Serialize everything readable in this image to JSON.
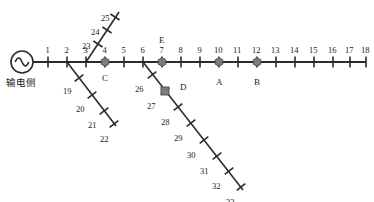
{
  "figure": {
    "title": "",
    "source": {
      "symbol_name": "ac-source-symbol",
      "label": "输电侧",
      "label_x": 6,
      "label_y": 78,
      "cx": 22,
      "cy": 62,
      "r": 11
    },
    "colors": {
      "line": "#2b2b2b",
      "marker_fill": "#7d7d7d",
      "marker_stroke": "#4a4a4a",
      "text": "#1a1a1a",
      "background": "#ffffff"
    },
    "line_width": 1.6,
    "tick_length": 11
  },
  "chart_data": {
    "type": "diagram",
    "diagram_kind": "single-line power distribution feeder",
    "main_feeder": {
      "y": 62,
      "x_start": 33,
      "x_end": 366,
      "nodes": [
        {
          "id": "1",
          "x": 48
        },
        {
          "id": "2",
          "x": 67
        },
        {
          "id": "3",
          "x": 86
        },
        {
          "id": "4",
          "x": 105
        },
        {
          "id": "5",
          "x": 124
        },
        {
          "id": "6",
          "x": 143
        },
        {
          "id": "7",
          "x": 162
        },
        {
          "id": "8",
          "x": 181
        },
        {
          "id": "9",
          "x": 200
        },
        {
          "id": "10",
          "x": 219
        },
        {
          "id": "11",
          "x": 238
        },
        {
          "id": "12",
          "x": 257
        },
        {
          "id": "13",
          "x": 276
        },
        {
          "id": "14",
          "x": 295
        },
        {
          "id": "15",
          "x": 314
        },
        {
          "id": "16",
          "x": 333
        },
        {
          "id": "17",
          "x": 350
        },
        {
          "id": "18",
          "x": 366
        }
      ]
    },
    "branches": [
      {
        "name": "upper-branch-from-node-3",
        "from_node": "3",
        "origin": {
          "x": 86,
          "y": 62
        },
        "end": {
          "x": 119,
          "y": 12
        },
        "nodes": [
          {
            "id": "23",
            "x": 98,
            "y": 44,
            "label_dx": -16,
            "label_dy": -2
          },
          {
            "id": "24",
            "x": 107,
            "y": 30,
            "label_dx": -16,
            "label_dy": -2
          },
          {
            "id": "25",
            "x": 115,
            "y": 17,
            "label_dx": -14,
            "label_dy": -3
          }
        ]
      },
      {
        "name": "lower-left-branch-from-node-2",
        "from_node": "2",
        "origin": {
          "x": 67,
          "y": 62
        },
        "end": {
          "x": 116,
          "y": 126
        },
        "nodes": [
          {
            "id": "19",
            "x": 79,
            "y": 78,
            "label_dx": -16,
            "label_dy": 9
          },
          {
            "id": "20",
            "x": 92,
            "y": 95,
            "label_dx": -16,
            "label_dy": 10
          },
          {
            "id": "21",
            "x": 104,
            "y": 111,
            "label_dx": -16,
            "label_dy": 10
          },
          {
            "id": "22",
            "x": 114,
            "y": 124,
            "label_dx": -14,
            "label_dy": 11
          }
        ]
      },
      {
        "name": "lower-right-branch-from-node-6",
        "from_node": "6",
        "origin": {
          "x": 143,
          "y": 62
        },
        "end": {
          "x": 243,
          "y": 190
        },
        "nodes": [
          {
            "id": "26",
            "x": 152,
            "y": 75,
            "label_dx": -17,
            "label_dy": 10
          },
          {
            "id": "27",
            "x": 165,
            "y": 91,
            "label_dx": -18,
            "label_dy": 11
          },
          {
            "id": "28",
            "x": 178,
            "y": 107,
            "label_dx": -17,
            "label_dy": 11
          },
          {
            "id": "29",
            "x": 191,
            "y": 123,
            "label_dx": -17,
            "label_dy": 11
          },
          {
            "id": "30",
            "x": 204,
            "y": 140,
            "label_dx": -17,
            "label_dy": 11
          },
          {
            "id": "31",
            "x": 217,
            "y": 156,
            "label_dx": -17,
            "label_dy": 11
          },
          {
            "id": "32",
            "x": 229,
            "y": 171,
            "label_dx": -17,
            "label_dy": 11
          },
          {
            "id": "33",
            "x": 241,
            "y": 187,
            "label_dx": -15,
            "label_dy": 11
          }
        ]
      }
    ],
    "markers": [
      {
        "label": "C",
        "node": "4",
        "x": 105,
        "y": 62,
        "shape": "hexagon",
        "label_x": 102,
        "label_y": 74
      },
      {
        "label": "E",
        "node": "7",
        "x": 162,
        "y": 62,
        "shape": "hexagon",
        "label_x": 159,
        "label_y": 36
      },
      {
        "label": "A",
        "node": "10",
        "x": 219,
        "y": 62,
        "shape": "hexagon",
        "label_x": 216,
        "label_y": 78
      },
      {
        "label": "B",
        "node": "12",
        "x": 257,
        "y": 62,
        "shape": "hexagon",
        "label_x": 254,
        "label_y": 78
      },
      {
        "label": "D",
        "node": "27",
        "x": 165,
        "y": 91,
        "shape": "square",
        "label_x": 180,
        "label_y": 83
      }
    ]
  }
}
